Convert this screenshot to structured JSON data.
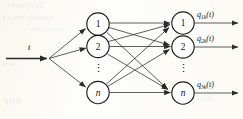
{
  "figure": {
    "input": {
      "label": "t",
      "arrow_name": "input-arrow"
    },
    "hidden_layer": {
      "name": "hidden-layer",
      "nodes": [
        {
          "label": "1",
          "italic": false
        },
        {
          "label": "2",
          "italic": false
        },
        {
          "label": "n",
          "italic": true
        }
      ],
      "ellipsis": "⋮"
    },
    "output_layer": {
      "name": "output-layer",
      "nodes": [
        {
          "label": "1",
          "italic": false
        },
        {
          "label": "2",
          "italic": false
        },
        {
          "label": "n",
          "italic": true
        }
      ],
      "ellipsis": "⋮"
    },
    "output_signals": [
      {
        "base": "q",
        "sub": "1k",
        "arg": "(t)",
        "full": "q1k(t)"
      },
      {
        "base": "q",
        "sub": "2k",
        "arg": "(t)",
        "full": "q2k(t)"
      },
      {
        "base": "q",
        "sub": "3k",
        "arg": "(t)",
        "full": "q3k(t)"
      }
    ],
    "colors": {
      "ink": "#1c1c1c",
      "paper": "#fcfcfa",
      "edge": "#2a2a2a",
      "ghost": "#a38c56"
    },
    "bleed_through": [
      "Документ",
      "пример текста",
      "схема сети",
      "Amp",
      "2021",
      "pro",
      "Sum"
    ]
  }
}
